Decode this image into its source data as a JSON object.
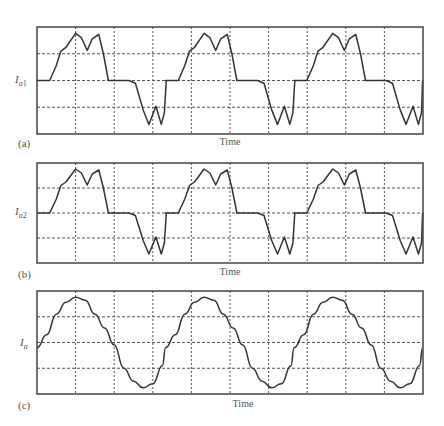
{
  "figure": {
    "panels": [
      {
        "letter": "(a)",
        "ylabel_main": "I",
        "ylabel_sub": "a",
        "ylabel_num": "1",
        "xlabel": "Time"
      },
      {
        "letter": "(b)",
        "ylabel_main": "I",
        "ylabel_sub": "a",
        "ylabel_num": "2",
        "xlabel": "Time"
      },
      {
        "letter": "(c)",
        "ylabel_main": "I",
        "ylabel_sub": "a",
        "ylabel_num": "",
        "xlabel": "Time"
      }
    ]
  },
  "chart_data": [
    {
      "type": "line",
      "title": "",
      "panel": "(a)",
      "xlabel": "Time",
      "ylabel": "I_a1",
      "grid": true,
      "x_divisions": 10,
      "y_divisions": 4,
      "note": "No numeric scales shown. Values are normalized estimates traced from pixels: y in [-1,1] (0 = center gridline, ±1 = frame edge); x in gridline divisions [0,10]. Shape only, not measured amplitudes.",
      "waveform_description": "Quasi-square stepped current: zero dwell, then positive double-hump lobe, zero dwell, negative double-dip lobe; ~3 cycles",
      "x": [
        0,
        0.33,
        0.5,
        0.62,
        0.75,
        1.0,
        1.15,
        1.3,
        1.43,
        1.6,
        1.72,
        1.85,
        2.0,
        2.05,
        2.2,
        2.38,
        2.55,
        2.75,
        2.9,
        3.08,
        3.22,
        3.3,
        3.35
      ],
      "values": [
        0,
        0,
        0.28,
        0.55,
        0.62,
        0.88,
        0.8,
        0.56,
        0.78,
        0.86,
        0.5,
        0,
        0,
        0,
        0,
        0,
        -0.05,
        -0.55,
        -0.82,
        -0.48,
        -0.82,
        -0.6,
        0
      ],
      "period_divisions": 3.33,
      "cycles_visible": 3
    },
    {
      "type": "line",
      "title": "",
      "panel": "(b)",
      "xlabel": "Time",
      "ylabel": "I_a2",
      "grid": true,
      "x_divisions": 10,
      "y_divisions": 4,
      "note": "Normalized estimates traced from pixels; no numeric scales shown. Shape matches panel (a).",
      "waveform_description": "Same stepped double-hump waveform as I_a1",
      "x": [
        0,
        0.33,
        0.5,
        0.62,
        0.75,
        1.0,
        1.15,
        1.3,
        1.43,
        1.6,
        1.72,
        1.85,
        2.0,
        2.05,
        2.2,
        2.38,
        2.55,
        2.75,
        2.9,
        3.08,
        3.22,
        3.3,
        3.35
      ],
      "values": [
        0,
        0,
        0.28,
        0.55,
        0.62,
        0.88,
        0.8,
        0.56,
        0.78,
        0.86,
        0.5,
        0,
        0,
        0,
        0,
        0,
        -0.05,
        -0.55,
        -0.82,
        -0.48,
        -0.82,
        -0.6,
        0
      ],
      "period_divisions": 3.33,
      "cycles_visible": 3
    },
    {
      "type": "line",
      "title": "",
      "panel": "(c)",
      "xlabel": "Time",
      "ylabel": "I_a",
      "grid": true,
      "x_divisions": 10,
      "y_divisions": 4,
      "note": "Normalized estimates traced from pixels; no numeric scales shown.",
      "waveform_description": "Near-sinusoidal total current with small ripple; ~3 cycles",
      "x": [
        0,
        0.25,
        0.5,
        0.75,
        1.0,
        1.25,
        1.5,
        1.75,
        2.0,
        2.25,
        2.5,
        2.75,
        3.0,
        3.25,
        3.33
      ],
      "values": [
        -0.1,
        0.15,
        0.55,
        0.78,
        0.88,
        0.82,
        0.55,
        0.28,
        -0.05,
        -0.5,
        -0.75,
        -0.88,
        -0.8,
        -0.45,
        -0.1
      ],
      "period_divisions": 3.33,
      "cycles_visible": 3
    }
  ]
}
